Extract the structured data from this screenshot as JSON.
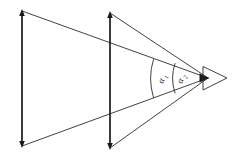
{
  "figure": {
    "kind": "ray-diagram",
    "background_color": "#ffffff",
    "ink_color": "#1a1a1a",
    "width": 233,
    "height": 157
  },
  "labels": {
    "angle_1": {
      "symbol": "α",
      "subscript": "1",
      "text": "α1",
      "x": 163,
      "y": 84,
      "rotation": -68
    },
    "angle_2": {
      "symbol": "α",
      "subscript": "2",
      "text": "α2",
      "x": 182,
      "y": 84,
      "rotation": -68
    }
  },
  "elements": {
    "left_aperture": {
      "name": "left vertical line with arrowheads",
      "x": 22,
      "y_top": 11,
      "y_bottom": 146
    },
    "middle_aperture": {
      "name": "middle vertical line with arrowheads",
      "x": 110,
      "y_top": 13,
      "y_bottom": 148
    },
    "apex": {
      "name": "convergence point with arrowhead",
      "x": 209,
      "y": 78
    },
    "arc_1": {
      "name": "inner angle arc",
      "radius": 48
    },
    "arc_2": {
      "name": "outer angle arc",
      "radius": 28
    }
  },
  "rays": [
    {
      "name": "upper-outer-ray",
      "from_x": 22,
      "from_y": 11,
      "to_x": 209,
      "to_y": 78
    },
    {
      "name": "lower-outer-ray",
      "from_x": 22,
      "from_y": 146,
      "to_x": 209,
      "to_y": 78
    },
    {
      "name": "upper-inner-ray",
      "from_x": 110,
      "from_y": 13,
      "to_x": 209,
      "to_y": 78
    },
    {
      "name": "lower-inner-ray",
      "from_x": 110,
      "from_y": 148,
      "to_x": 209,
      "to_y": 78
    }
  ]
}
